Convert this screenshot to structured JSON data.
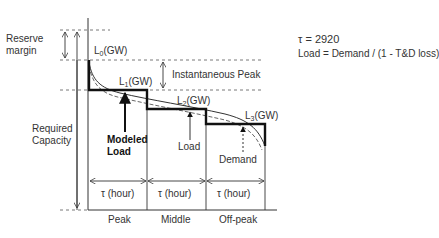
{
  "labels": {
    "reserve_margin_1": "Reserve",
    "reserve_margin_2": "margin",
    "required_capacity_1": "Required",
    "required_capacity_2": "Capacity",
    "l0": "L",
    "l0_sub": "0",
    "l0_unit": "(GW)",
    "l1": "L",
    "l1_sub": "1",
    "l1_unit": "(GW)",
    "l2": "L",
    "l2_sub": "2",
    "l2_unit": "(GW)",
    "l3": "L",
    "l3_sub": "3",
    "l3_unit": "(GW)",
    "instantaneous_peak": "Instantaneous Peak",
    "modeled_load_1": "Modeled",
    "modeled_load_2": "Load",
    "load": "Load",
    "demand": "Demand",
    "tau_eq": "τ = 2920",
    "load_formula": "Load = Demand / (1 - T&D loss)",
    "tau_hour_1": "τ (hour)",
    "tau_hour_2": "τ (hour)",
    "tau_hour_3": "τ (hour)",
    "period_peak": "Peak",
    "period_middle": "Middle",
    "period_offpeak": "Off-peak"
  },
  "colors": {
    "line": "#222222",
    "dash": "#555555",
    "text": "#333333"
  }
}
